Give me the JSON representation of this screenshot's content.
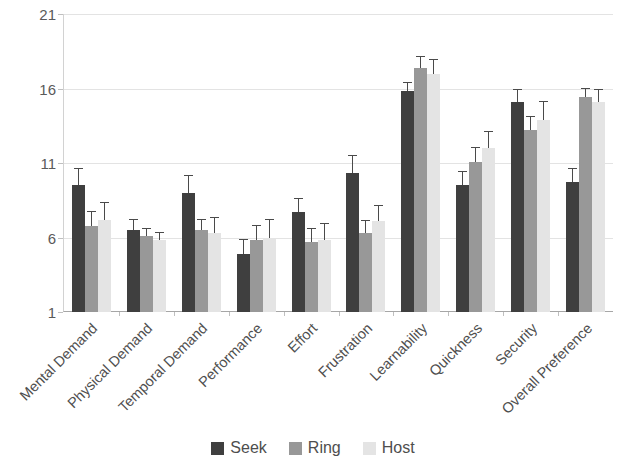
{
  "chart_data": {
    "type": "bar",
    "title": "",
    "subtitle": "",
    "xlabel": "",
    "ylabel": "",
    "ylim": [
      1,
      21
    ],
    "yticks": [
      1,
      6,
      11,
      16,
      21
    ],
    "grid": true,
    "legend_position": "bottom",
    "orientation": "vertical",
    "error_bars": true,
    "categories": [
      "Mental Demand",
      "Physical Demand",
      "Temporal Demand",
      "Performance",
      "Effort",
      "Frustration",
      "Learnability",
      "Quickness",
      "Security",
      "Overall Preference"
    ],
    "series": [
      {
        "name": "Seek",
        "color": "#3f3f3f",
        "values": [
          9.5,
          6.5,
          9.0,
          4.9,
          7.7,
          10.3,
          15.8,
          9.5,
          15.1,
          9.7
        ],
        "errors": [
          1.1,
          0.7,
          1.1,
          0.9,
          0.9,
          1.2,
          0.6,
          0.9,
          0.8,
          0.9
        ]
      },
      {
        "name": "Ring",
        "color": "#989898",
        "values": [
          6.8,
          6.1,
          6.5,
          5.8,
          5.7,
          6.3,
          17.4,
          11.1,
          13.2,
          15.4
        ],
        "errors": [
          0.9,
          0.5,
          0.7,
          1.0,
          0.9,
          0.8,
          0.7,
          0.9,
          0.9,
          0.6
        ]
      },
      {
        "name": "Host",
        "color": "#e4e4e4",
        "values": [
          7.2,
          5.8,
          6.3,
          6.0,
          5.8,
          7.1,
          17.0,
          12.0,
          13.9,
          15.1
        ],
        "errors": [
          1.1,
          0.5,
          1.0,
          1.2,
          1.1,
          1.0,
          0.9,
          1.1,
          1.2,
          0.8
        ]
      }
    ]
  },
  "legend": {
    "items": [
      {
        "label": "Seek",
        "key": "seek"
      },
      {
        "label": "Ring",
        "key": "ring"
      },
      {
        "label": "Host",
        "key": "host"
      }
    ]
  }
}
